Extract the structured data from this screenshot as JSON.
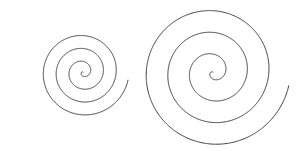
{
  "figure": {
    "width": 304,
    "height": 151,
    "background_color": "#ffffff",
    "stroke_color": "#3c3c42",
    "stroke_width": 1.0
  },
  "chart_data": {
    "type": "line",
    "subtitle": "",
    "xlabel": "",
    "ylabel": "",
    "grid": false,
    "legend": "none",
    "axes_visible": false,
    "tick_labels": [],
    "annotations": [],
    "xlim": [
      0,
      304
    ],
    "ylim": [
      0,
      151
    ],
    "series": [
      {
        "name": "left-spiral",
        "kind": "archimedean_spiral",
        "color": "#3c3c42",
        "linewidth": 1.0,
        "center": [
          83,
          72
        ],
        "a": 0.0,
        "b": 2.05,
        "theta_start": 0.0,
        "theta_end": 22.3,
        "theta_units": "radians",
        "turns": 3.55,
        "start_angle_deg": 152,
        "direction": "counterclockwise",
        "r_max": 46,
        "bbox": [
          18,
          18,
          128,
          134
        ],
        "endpoint_inner": [
          84,
          71
        ],
        "endpoint_outer": [
          43,
          133
        ]
      },
      {
        "name": "right-spiral",
        "kind": "archimedean_spiral",
        "color": "#3c3c42",
        "linewidth": 1.0,
        "center": [
          213,
          72
        ],
        "a": 0.0,
        "b": 3.45,
        "theta_start": 0.0,
        "theta_end": 22.3,
        "theta_units": "radians",
        "turns": 3.55,
        "start_angle_deg": 152,
        "direction": "counterclockwise",
        "r_max": 77,
        "bbox": [
          153,
          21,
          291,
          135
        ],
        "endpoint_inner": [
          214,
          71
        ],
        "endpoint_outer": [
          290,
          63
        ]
      }
    ]
  }
}
